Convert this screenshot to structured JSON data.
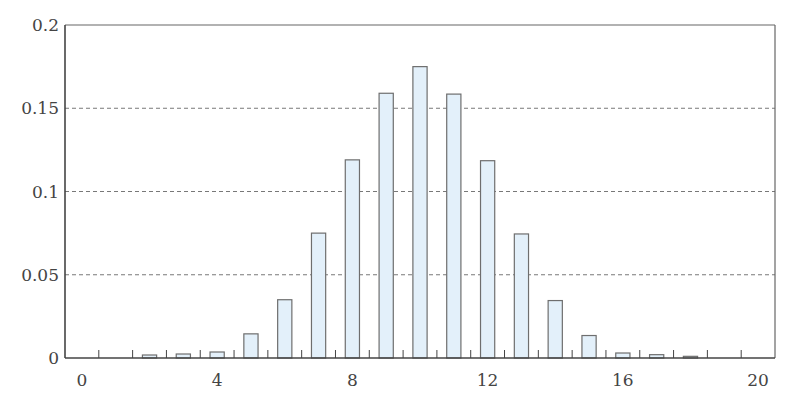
{
  "chart_data": {
    "type": "bar",
    "title": "",
    "xlabel": "",
    "ylabel": "",
    "categories": [
      0,
      1,
      2,
      3,
      4,
      5,
      6,
      7,
      8,
      9,
      10,
      11,
      12,
      13,
      14,
      15,
      16,
      17,
      18,
      19,
      20
    ],
    "values": [
      0.0,
      0.0,
      0.0018,
      0.0024,
      0.0036,
      0.0145,
      0.035,
      0.075,
      0.119,
      0.159,
      0.175,
      0.1585,
      0.1185,
      0.0745,
      0.0345,
      0.0135,
      0.003,
      0.002,
      0.001,
      0.0,
      0.0
    ],
    "xlim": [
      -0.5,
      20.5
    ],
    "ylim": [
      0,
      0.2
    ],
    "x_ticks": [
      0,
      4,
      8,
      12,
      16,
      20
    ],
    "x_tick_labels": [
      "0",
      "4",
      "8",
      "12",
      "16",
      "20"
    ],
    "y_ticks": [
      0,
      0.05,
      0.1,
      0.15,
      0.2
    ],
    "y_tick_labels": [
      "0",
      "0.05",
      "0.1",
      "0.15",
      "0.2"
    ],
    "grid": {
      "y": true,
      "x": false,
      "style": "dashed"
    },
    "legend": null,
    "minor_x_ticks_at_half_integers": true,
    "colors": {
      "bar_fill": "#E3F0FA",
      "bar_stroke": "#6E6E6E",
      "axis": "#444444",
      "grid": "#555555",
      "label": "#444444"
    }
  }
}
